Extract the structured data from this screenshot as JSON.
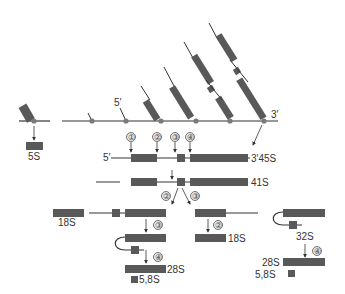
{
  "diagram": {
    "colors": {
      "box": "#595959",
      "line": "#333333",
      "node": "#7a7a7a",
      "circle_fill": "#e6e6e6"
    },
    "labels": {
      "five_s": "5S",
      "five_prime_top": "5′",
      "three_prime_top": "3′",
      "five_prime_45s": "5′",
      "label_45s": "3′45S",
      "label_41s": "41S",
      "label_18s_left": "18S",
      "label_18s_right": "18S",
      "label_32s": "32S",
      "label_28s_left": "28S",
      "label_58s_left": "5,8S",
      "label_28s_right": "28S",
      "label_58s_right": "5,8S"
    },
    "cleavage_sites": {
      "s1": "①",
      "s2": "②",
      "s3": "③",
      "s4": "④"
    },
    "step_markers": {
      "split_left": "②",
      "split_right": "③",
      "step_left_3": "③",
      "step_left_4": "④",
      "step_mid_2": "②",
      "step_right_4": "④"
    }
  }
}
